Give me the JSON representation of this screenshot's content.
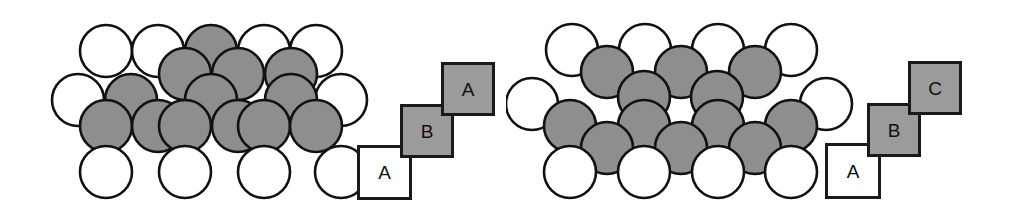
{
  "figure": {
    "width": 1013,
    "height": 204,
    "background": "#ffffff",
    "colors": {
      "sphere_gray_fill": "#8e8e8e",
      "sphere_white_fill": "#ffffff",
      "sphere_outline": "#111111",
      "square_gray_fill": "#9b9b9b",
      "square_white_fill": "#ffffff",
      "square_outline": "#1a1a1a",
      "label_text": "#111111"
    },
    "sphere_radius": 26,
    "sphere_outline_width": 2.6
  },
  "panels": [
    {
      "id": "hcp",
      "name": "hexagonal-close-packed-stacking",
      "stacking_sequence": "ABA",
      "spheres": [
        {
          "cx": 106,
          "cy": 51,
          "fill": "white",
          "layer": "A"
        },
        {
          "cx": 211,
          "cy": 51,
          "fill": "gray",
          "layer": "B"
        },
        {
          "cx": 264,
          "cy": 51,
          "fill": "white",
          "layer": "A"
        },
        {
          "cx": 316,
          "cy": 51,
          "fill": "white",
          "layer": "A"
        },
        {
          "cx": 158,
          "cy": 51,
          "fill": "white",
          "layer": "A"
        },
        {
          "cx": 185,
          "cy": 74,
          "fill": "gray",
          "layer": "B"
        },
        {
          "cx": 238,
          "cy": 74,
          "fill": "gray",
          "layer": "B"
        },
        {
          "cx": 291,
          "cy": 74,
          "fill": "gray",
          "layer": "B"
        },
        {
          "cx": 78,
          "cy": 100,
          "fill": "white",
          "layer": "A"
        },
        {
          "cx": 341,
          "cy": 100,
          "fill": "white",
          "layer": "A"
        },
        {
          "cx": 131,
          "cy": 100,
          "fill": "gray",
          "layer": "A"
        },
        {
          "cx": 211,
          "cy": 100,
          "fill": "gray",
          "layer": "A"
        },
        {
          "cx": 291,
          "cy": 100,
          "fill": "gray",
          "layer": "A"
        },
        {
          "cx": 106,
          "cy": 126,
          "fill": "gray",
          "layer": "A"
        },
        {
          "cx": 158,
          "cy": 126,
          "fill": "gray",
          "layer": "A"
        },
        {
          "cx": 185,
          "cy": 126,
          "fill": "gray",
          "layer": "A"
        },
        {
          "cx": 238,
          "cy": 126,
          "fill": "gray",
          "layer": "A"
        },
        {
          "cx": 264,
          "cy": 126,
          "fill": "gray",
          "layer": "A"
        },
        {
          "cx": 316,
          "cy": 126,
          "fill": "gray",
          "layer": "A"
        },
        {
          "cx": 106,
          "cy": 172,
          "fill": "white",
          "layer": "A"
        },
        {
          "cx": 185,
          "cy": 172,
          "fill": "white",
          "layer": "A"
        },
        {
          "cx": 264,
          "cy": 172,
          "fill": "white",
          "layer": "A"
        },
        {
          "cx": 341,
          "cy": 172,
          "fill": "white",
          "layer": "A"
        }
      ],
      "legend": {
        "name": "aba-stacking-legend",
        "squares": [
          {
            "label": "A",
            "fill": "white",
            "x": 357,
            "y": 145,
            "size": 55
          },
          {
            "label": "B",
            "fill": "gray",
            "x": 400,
            "y": 104,
            "size": 54
          },
          {
            "label": "A",
            "fill": "gray",
            "x": 441,
            "y": 62,
            "size": 54
          }
        ]
      }
    },
    {
      "id": "fcc",
      "name": "face-centered-cubic-stacking",
      "stacking_sequence": "ABC",
      "spheres": [
        {
          "cx": 66,
          "cy": 50,
          "fill": "white",
          "layer": "A"
        },
        {
          "cx": 139,
          "cy": 50,
          "fill": "white",
          "layer": "A"
        },
        {
          "cx": 212,
          "cy": 50,
          "fill": "white",
          "layer": "A"
        },
        {
          "cx": 285,
          "cy": 50,
          "fill": "white",
          "layer": "A"
        },
        {
          "cx": 101,
          "cy": 72,
          "fill": "gray",
          "layer": "C"
        },
        {
          "cx": 175,
          "cy": 72,
          "fill": "gray",
          "layer": "C"
        },
        {
          "cx": 249,
          "cy": 72,
          "fill": "gray",
          "layer": "C"
        },
        {
          "cx": 138,
          "cy": 97,
          "fill": "gray",
          "layer": "B"
        },
        {
          "cx": 211,
          "cy": 97,
          "fill": "gray",
          "layer": "B"
        },
        {
          "cx": 26,
          "cy": 104,
          "fill": "white",
          "layer": "A"
        },
        {
          "cx": 320,
          "cy": 104,
          "fill": "white",
          "layer": "A"
        },
        {
          "cx": 64,
          "cy": 126,
          "fill": "gray",
          "layer": "B"
        },
        {
          "cx": 138,
          "cy": 126,
          "fill": "gray",
          "layer": "B"
        },
        {
          "cx": 212,
          "cy": 126,
          "fill": "gray",
          "layer": "B"
        },
        {
          "cx": 285,
          "cy": 126,
          "fill": "gray",
          "layer": "B"
        },
        {
          "cx": 101,
          "cy": 148,
          "fill": "gray",
          "layer": "A"
        },
        {
          "cx": 175,
          "cy": 148,
          "fill": "gray",
          "layer": "A"
        },
        {
          "cx": 249,
          "cy": 148,
          "fill": "gray",
          "layer": "A"
        },
        {
          "cx": 64,
          "cy": 172,
          "fill": "white",
          "layer": "A"
        },
        {
          "cx": 138,
          "cy": 172,
          "fill": "white",
          "layer": "A"
        },
        {
          "cx": 212,
          "cy": 172,
          "fill": "white",
          "layer": "A"
        },
        {
          "cx": 285,
          "cy": 172,
          "fill": "white",
          "layer": "A"
        }
      ],
      "legend": {
        "name": "abc-stacking-legend",
        "squares": [
          {
            "label": "A",
            "fill": "white",
            "x": 319,
            "y": 143,
            "size": 56
          },
          {
            "label": "B",
            "fill": "gray",
            "x": 361,
            "y": 103,
            "size": 54
          },
          {
            "label": "C",
            "fill": "gray",
            "x": 402,
            "y": 61,
            "size": 54
          }
        ]
      }
    }
  ]
}
